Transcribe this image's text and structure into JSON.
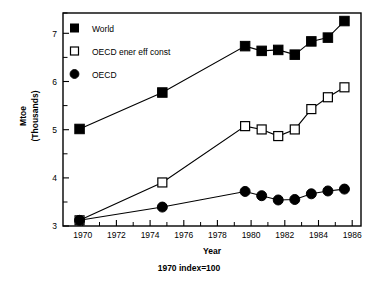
{
  "chart_data": {
    "type": "line",
    "title": "",
    "subtitle": "1970 index=100",
    "xlabel": "Year",
    "ylabel": "Mtoe\n(Thousands)",
    "ylabel_line1": "Mtoe",
    "ylabel_line2": "(Thousands)",
    "xlim": [
      1969,
      1987
    ],
    "ylim": [
      3,
      7.5
    ],
    "grid": false,
    "legend_position": "top-left",
    "x_ticks": [
      1970,
      1972,
      1974,
      1976,
      1978,
      1980,
      1982,
      1984,
      1986
    ],
    "x_tick_labels": [
      "1970",
      "1972",
      "1974",
      "1976",
      "1978",
      "1980",
      "1982",
      "1984",
      "1986"
    ],
    "x_minor_ticks": [
      1971,
      1973,
      1975,
      1977,
      1979,
      1981,
      1983,
      1985
    ],
    "y_ticks": [
      3,
      4,
      5,
      6,
      7
    ],
    "y_tick_labels": [
      "3",
      "4",
      "5",
      "6",
      "7"
    ],
    "y_minor_ticks": [
      3.5,
      4.5,
      5.5,
      6.5,
      7.5
    ],
    "series": [
      {
        "name": "World",
        "marker": "filled-square",
        "x": [
          1970,
          1975,
          1980,
          1981,
          1982,
          1983,
          1984,
          1985,
          1986
        ],
        "values": [
          5.05,
          5.82,
          6.8,
          6.7,
          6.72,
          6.62,
          6.9,
          6.98,
          7.33
        ]
      },
      {
        "name": "OECD ener eff const",
        "marker": "open-square",
        "x": [
          1970,
          1975,
          1980,
          1981,
          1982,
          1983,
          1984,
          1985,
          1986
        ],
        "values": [
          3.12,
          3.92,
          5.11,
          5.04,
          4.9,
          5.04,
          5.47,
          5.72,
          5.93
        ]
      },
      {
        "name": "OECD",
        "marker": "filled-circle",
        "x": [
          1970,
          1975,
          1980,
          1981,
          1982,
          1983,
          1984,
          1985,
          1986
        ],
        "values": [
          3.12,
          3.4,
          3.73,
          3.64,
          3.55,
          3.56,
          3.68,
          3.74,
          3.78
        ]
      }
    ]
  },
  "legend": {
    "items": [
      {
        "label": "World",
        "marker": "filled-square"
      },
      {
        "label": "OECD ener eff const",
        "marker": "open-square"
      },
      {
        "label": "OECD",
        "marker": "filled-circle"
      }
    ]
  },
  "axes": {
    "x_title": "Year",
    "y_title_line1": "Mtoe",
    "y_title_line2": "(Thousands)"
  },
  "caption": "1970 index=100"
}
